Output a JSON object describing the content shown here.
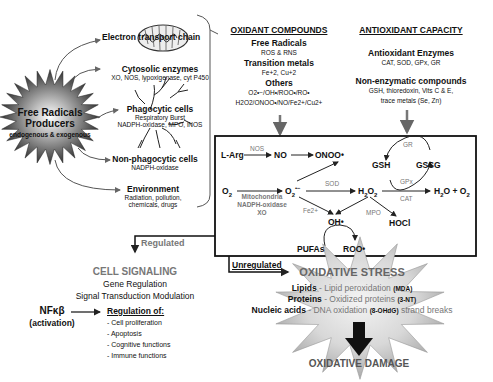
{
  "producers": {
    "title_line1": "Free Radicals",
    "title_line2": "Producers",
    "subtitle": "endogenous & exogenous",
    "sources": [
      {
        "title": "Electron transport chain",
        "detail": ""
      },
      {
        "title": "Cytosolic enzymes",
        "detail": "XO, NOS, lypoxigenase, cyt P450"
      },
      {
        "title": "Phagocytic cells",
        "detail": "Respiratory Burst",
        "detail2": "NADPH-oxidase, MPO, iNOS"
      },
      {
        "title": "Non-phagocytic cells",
        "detail": "NADPH-oxidase"
      },
      {
        "title": "Environment",
        "detail": "Radiation, pollution,",
        "detail2": "chemicals, drugs"
      }
    ]
  },
  "oxidant_compounds": {
    "header": "OXIDANT COMPOUNDS",
    "groups": [
      {
        "title": "Free Radicals",
        "items": "ROS & RNS"
      },
      {
        "title": "Transition metals",
        "items": "Fe+2, Cu+2"
      },
      {
        "title": "Others",
        "items": "O2•−/OH•/ROO•/RO•",
        "items2": "H2O2/ONOO•/NO/Fe2+/Cu2+"
      }
    ]
  },
  "antioxidant_capacity": {
    "header": "ANTIOXIDANT CAPACITY",
    "groups": [
      {
        "title": "Antioxidant Enzymes",
        "items": "CAT, SOD, GPx, GR"
      },
      {
        "title": "Non-enzymatic compounds",
        "items": "GSH, thioredoxin, Vits C & E,",
        "items2": "trace metals (Se, Zn)"
      }
    ]
  },
  "reactions": {
    "l_arg": "L-Arg",
    "nos": "NOS",
    "no": "NO",
    "onoo": "ONOO•",
    "o2": "O",
    "o2_sub": "2",
    "o2_sources": [
      "Mitochondria",
      "NADPH-oxidase",
      "XO"
    ],
    "superoxide": "O",
    "superoxide_sub": "2",
    "superoxide_sup": "•−",
    "sod": "SOD",
    "h2o2": "H",
    "h2o2_sub1": "2",
    "h2o2_o": "O",
    "h2o2_sub2": "2",
    "cat": "CAT",
    "h2o_o2": "H",
    "h2o_sub": "2",
    "h2o_rest": "O + O",
    "h2o_o2_sub": "2",
    "gsh": "GSH",
    "gssg": "GSSG",
    "gr": "GR",
    "gpx": "GPx",
    "fe2": "Fe2+",
    "mpo": "MPO",
    "oh": "OH•",
    "hocl": "HOCl",
    "pufas": "PUFAs",
    "roo": "ROO•"
  },
  "pathways": {
    "regulated": "Regulated",
    "unregulated": "Unregulated"
  },
  "cell_signaling": {
    "title": "CELL SIGNALING",
    "line1": "Gene Regulation",
    "line2": "Signal Transduction Modulation",
    "nfkb": "NFκβ",
    "activation": "(activation)",
    "regulation_header": "Regulation of:",
    "items": [
      "- Cell proliferation",
      "- Apoptosis",
      "- Cognitive functions",
      "- Immune functions"
    ]
  },
  "oxidative_stress": {
    "title": "OXIDATIVE STRESS",
    "rows": [
      {
        "label": "Lipids",
        "text": " - Lipid peroxidation ",
        "marker": "(MDA)",
        "tail": ""
      },
      {
        "label": "Proteins",
        "text": " - Oxidized proteins ",
        "marker": "(3-NT)",
        "tail": ""
      },
      {
        "label": "Nucleic acids",
        "text": " - DNA oxidation ",
        "marker": "(8-OHdG)",
        "tail": " strand breaks"
      }
    ],
    "damage": "OXIDATIVE DAMAGE"
  }
}
